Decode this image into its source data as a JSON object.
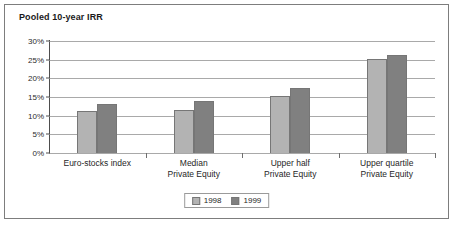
{
  "chart_data": {
    "type": "bar",
    "title": "Pooled 10-year IRR",
    "xlabel": "",
    "ylabel": "",
    "ylim": [
      0,
      30
    ],
    "ytick_labels": [
      "30%",
      "25%",
      "20%",
      "15%",
      "10%",
      "5%",
      "0%"
    ],
    "ytick_values": [
      30,
      25,
      20,
      15,
      10,
      5,
      0
    ],
    "grid": true,
    "legend_position": "bottom-center",
    "categories": [
      "Euro-stocks index",
      "Median Private Equity",
      "Upper half Private Equity",
      "Upper quartile Private Equity"
    ],
    "category_lines": [
      [
        "Euro-stocks index"
      ],
      [
        "Median",
        "Private Equity"
      ],
      [
        "Upper half",
        "Private Equity"
      ],
      [
        "Upper quartile",
        "Private Equity"
      ]
    ],
    "series": [
      {
        "name": "1998",
        "color": "#b3b3b3",
        "values": [
          11.3,
          11.4,
          15.4,
          25.3
        ]
      },
      {
        "name": "1999",
        "color": "#808080",
        "values": [
          13.2,
          13.8,
          17.3,
          26.2
        ]
      }
    ]
  },
  "colors": {
    "frame_border": "#7d7d7d",
    "gridline": "#a9a9a9",
    "axis": "#4d4d4d",
    "series_1998": "#b3b3b3",
    "series_1999": "#808080",
    "text": "#1f1f1f"
  }
}
